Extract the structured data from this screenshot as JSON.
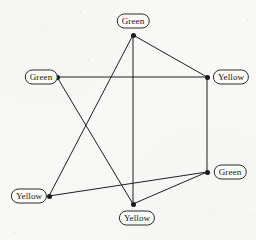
{
  "figure": {
    "background_color": "#f8f8f6",
    "ink_color": "#1a1a1a",
    "label_border_color": "#2b2b2b",
    "width": 256,
    "height": 240
  },
  "chart_data": {
    "type": "diagram",
    "xlabel": "",
    "ylabel": "",
    "xlim": [
      0,
      256
    ],
    "ylim": [
      0,
      240
    ],
    "grid": false,
    "legend": "none",
    "node_count": 6,
    "edge_count": 8,
    "color_values": [
      "Green",
      "Yellow"
    ],
    "nodes": [
      {
        "id": "n-top",
        "label": "Green",
        "x": 133,
        "y": 35,
        "label_x": 133,
        "label_y": 21,
        "label_anchor": "above"
      },
      {
        "id": "n-left",
        "label": "Green",
        "x": 57,
        "y": 77,
        "label_x": 41,
        "label_y": 77,
        "label_anchor": "left"
      },
      {
        "id": "n-right-top",
        "label": "Yellow",
        "x": 207,
        "y": 77,
        "label_x": 231,
        "label_y": 77,
        "label_anchor": "right"
      },
      {
        "id": "n-right-bottom",
        "label": "Green",
        "x": 207,
        "y": 172,
        "label_x": 230,
        "label_y": 172,
        "label_anchor": "right"
      },
      {
        "id": "n-bottom-left",
        "label": "Yellow",
        "x": 49,
        "y": 196,
        "label_x": 29,
        "label_y": 196,
        "label_anchor": "left"
      },
      {
        "id": "n-bottom",
        "label": "Yellow",
        "x": 133,
        "y": 204,
        "label_x": 137,
        "label_y": 218,
        "label_anchor": "below"
      }
    ],
    "edges": [
      {
        "id": "e-left-righttop",
        "from": "n-left",
        "to": "n-right-top",
        "x1": 57,
        "y1": 77,
        "x2": 207,
        "y2": 77
      },
      {
        "id": "e-top-righttop",
        "from": "n-top",
        "to": "n-right-top",
        "x1": 133,
        "y1": 35,
        "x2": 207,
        "y2": 77
      },
      {
        "id": "e-top-bottom",
        "from": "n-top",
        "to": "n-bottom",
        "x1": 133,
        "y1": 35,
        "x2": 133,
        "y2": 204
      },
      {
        "id": "e-top-bottomleft",
        "from": "n-top",
        "to": "n-bottom-left",
        "x1": 133,
        "y1": 35,
        "x2": 49,
        "y2": 196
      },
      {
        "id": "e-left-bottom",
        "from": "n-left",
        "to": "n-bottom",
        "x1": 57,
        "y1": 77,
        "x2": 133,
        "y2": 204
      },
      {
        "id": "e-righttop-rightbottom",
        "from": "n-right-top",
        "to": "n-right-bottom",
        "x1": 207,
        "y1": 77,
        "x2": 207,
        "y2": 172
      },
      {
        "id": "e-bottomleft-rightbottom",
        "from": "n-bottom-left",
        "to": "n-right-bottom",
        "x1": 49,
        "y1": 196,
        "x2": 207,
        "y2": 172
      },
      {
        "id": "e-bottom-rightbottom",
        "from": "n-bottom",
        "to": "n-right-bottom",
        "x1": 133,
        "y1": 204,
        "x2": 207,
        "y2": 172
      }
    ]
  },
  "specks": [
    {
      "x": 80,
      "y": 12,
      "size": 1.4
    },
    {
      "x": 88,
      "y": 60,
      "size": 1.2
    },
    {
      "x": 247,
      "y": 20,
      "size": 1.1
    },
    {
      "x": 250,
      "y": 214,
      "size": 1.3
    },
    {
      "x": 132,
      "y": 208,
      "size": 1.2
    },
    {
      "x": 14,
      "y": 232,
      "size": 1.0
    }
  ]
}
